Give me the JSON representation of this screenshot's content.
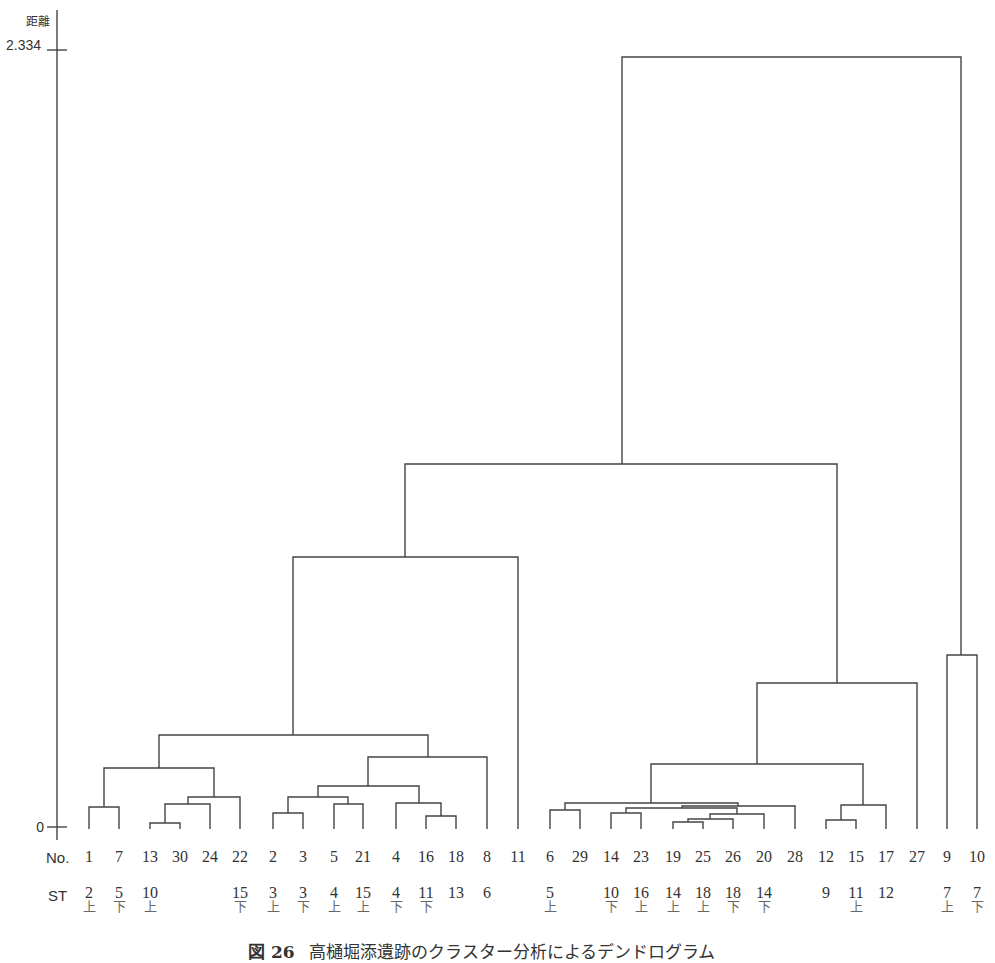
{
  "chart_data": {
    "type": "dendrogram",
    "title": "",
    "caption": {
      "figure_number": "図 26",
      "text": "高樋堀添遺跡のクラスター分析によるデンドログラム"
    },
    "ylabel": "距離",
    "ylim": [
      0,
      2.334
    ],
    "yticks": [
      {
        "label": "2.334",
        "value": 2.334
      },
      {
        "label": "0",
        "value": 0
      }
    ],
    "row_labels": {
      "no": "No.",
      "st": "ST"
    },
    "leaves": [
      {
        "no": "1",
        "st": "2",
        "pos": "上"
      },
      {
        "no": "7",
        "st": "5",
        "pos": "下"
      },
      {
        "no": "13",
        "st": "10",
        "pos": "上"
      },
      {
        "no": "30",
        "st": "",
        "pos": ""
      },
      {
        "no": "24",
        "st": "",
        "pos": ""
      },
      {
        "no": "22",
        "st": "15",
        "pos": "下"
      },
      {
        "no": "2",
        "st": "3",
        "pos": "上"
      },
      {
        "no": "3",
        "st": "3",
        "pos": "下"
      },
      {
        "no": "5",
        "st": "4",
        "pos": "上"
      },
      {
        "no": "21",
        "st": "15",
        "pos": "上"
      },
      {
        "no": "4",
        "st": "4",
        "pos": "下"
      },
      {
        "no": "16",
        "st": "11",
        "pos": "下"
      },
      {
        "no": "18",
        "st": "13",
        "pos": ""
      },
      {
        "no": "8",
        "st": "6",
        "pos": ""
      },
      {
        "no": "11",
        "st": "",
        "pos": ""
      },
      {
        "no": "6",
        "st": "5",
        "pos": "上"
      },
      {
        "no": "29",
        "st": "",
        "pos": ""
      },
      {
        "no": "14",
        "st": "10",
        "pos": "下"
      },
      {
        "no": "23",
        "st": "16",
        "pos": "上"
      },
      {
        "no": "19",
        "st": "14",
        "pos": "上"
      },
      {
        "no": "25",
        "st": "18",
        "pos": "上"
      },
      {
        "no": "26",
        "st": "18",
        "pos": "下"
      },
      {
        "no": "20",
        "st": "14",
        "pos": "下"
      },
      {
        "no": "28",
        "st": "",
        "pos": ""
      },
      {
        "no": "12",
        "st": "9",
        "pos": ""
      },
      {
        "no": "15",
        "st": "11",
        "pos": "上"
      },
      {
        "no": "17",
        "st": "12",
        "pos": ""
      },
      {
        "no": "27",
        "st": "",
        "pos": ""
      },
      {
        "no": "9",
        "st": "7",
        "pos": "上"
      },
      {
        "no": "10",
        "st": "7",
        "pos": "下"
      }
    ],
    "merges_approx_distance": [
      {
        "members": [
          "13",
          "30"
        ],
        "height": 0.01
      },
      {
        "members": [
          "19",
          "25"
        ],
        "height": 0.01
      },
      {
        "members": [
          "12",
          "15"
        ],
        "height": 0.02
      },
      {
        "members": [
          "16",
          "18"
        ],
        "height": 0.03
      },
      {
        "members": [
          "19-25",
          "26"
        ],
        "height": 0.02
      },
      {
        "members": [
          "19-25-26",
          "20"
        ],
        "height": 0.04
      },
      {
        "members": [
          "2",
          "3"
        ],
        "height": 0.05
      },
      {
        "members": [
          "6",
          "29"
        ],
        "height": 0.05
      },
      {
        "members": [
          "14",
          "23"
        ],
        "height": 0.05
      },
      {
        "members": [
          "1",
          "7"
        ],
        "height": 0.07
      },
      {
        "members": [
          "5",
          "21"
        ],
        "height": 0.07
      },
      {
        "members": [
          "4",
          "16-18"
        ],
        "height": 0.07
      },
      {
        "members": [
          "13-30",
          "24"
        ],
        "height": 0.07
      },
      {
        "members": [
          "12-15",
          "17"
        ],
        "height": 0.07
      },
      {
        "members": [
          "14-23",
          "19-25-26-20"
        ],
        "height": 0.07
      },
      {
        "members": [
          "14..20",
          "28"
        ],
        "height": 0.08
      },
      {
        "members": [
          "13-30-24",
          "22"
        ],
        "height": 0.09
      },
      {
        "members": [
          "2-3",
          "5-21"
        ],
        "height": 0.11
      },
      {
        "members": [
          "6-29",
          "14..28"
        ],
        "height": 0.09
      },
      {
        "members": [
          "2..21",
          "4-16-18"
        ],
        "height": 0.12
      },
      {
        "members": [
          "2..18",
          "8"
        ],
        "height": 0.16
      },
      {
        "members": [
          "1-7",
          "13..22"
        ],
        "height": 0.22
      },
      {
        "members": [
          "6..28",
          "12-15-17"
        ],
        "height": 0.25
      },
      {
        "members": [
          "1..22",
          "2..8"
        ],
        "height": 0.3
      },
      {
        "members": [
          "1..8",
          "11"
        ],
        "height": 0.91
      },
      {
        "members": [
          "6..17",
          "27"
        ],
        "height": 0.49
      },
      {
        "members": [
          "9",
          "10"
        ],
        "height": 0.56
      },
      {
        "members": [
          "1..11",
          "6..27"
        ],
        "height": 1.16
      },
      {
        "members": [
          "1..27",
          "9-10"
        ],
        "height": 2.334
      }
    ]
  }
}
